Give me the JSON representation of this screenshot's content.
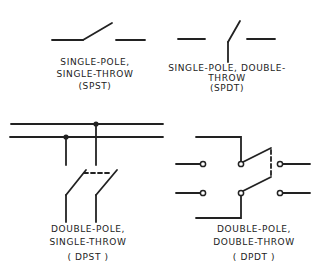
{
  "diagram": {
    "colors": {
      "ink": "#222222",
      "background": "#ffffff"
    },
    "switches": [
      {
        "id": "spst",
        "label_lines": [
          "SINGLE-POLE,",
          "SINGLE-THROW",
          "(SPST)"
        ]
      },
      {
        "id": "spdt",
        "label_lines": [
          "SINGLE-POLE, DOUBLE-",
          "THROW",
          "(SPDT)"
        ]
      },
      {
        "id": "dpst",
        "label_lines": [
          "DOUBLE-POLE,",
          "SINGLE-THROW",
          "( DPST )"
        ]
      },
      {
        "id": "dpdt",
        "label_lines": [
          "DOUBLE-POLE,",
          "DOUBLE-THROW",
          "( DPDT )"
        ]
      }
    ]
  }
}
